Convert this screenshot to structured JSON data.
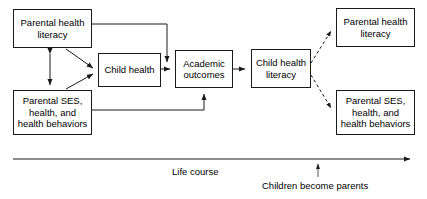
{
  "diagram": {
    "type": "flow-diagram",
    "background_color": "#ffffff",
    "stroke_color": "#1a1a1a",
    "text_color": "#000000",
    "nodes": [
      {
        "id": "parental-health-literacy-left",
        "label": "Parental health\nliteracy",
        "lines": [
          "Parental health",
          "literacy"
        ],
        "x": 13,
        "y": 9,
        "width": 79,
        "height": 39
      },
      {
        "id": "parental-ses-left",
        "label": "Parental SES,\nhealth, and\nhealth behaviors",
        "lines": [
          "Parental SES,",
          "health, and",
          "health behaviors"
        ],
        "x": 13,
        "y": 90,
        "width": 79,
        "height": 45
      },
      {
        "id": "child-health",
        "label": "Child health",
        "lines": [
          "Child health"
        ],
        "x": 98,
        "y": 53,
        "width": 63,
        "height": 34
      },
      {
        "id": "academic-outcomes",
        "label": "Academic\noutcomes",
        "lines": [
          "Academic",
          "outcomes"
        ],
        "x": 175,
        "y": 50,
        "width": 58,
        "height": 38
      },
      {
        "id": "child-health-literacy",
        "label": "Child health\nliteracy",
        "lines": [
          "Child health",
          "literacy"
        ],
        "x": 251,
        "y": 49,
        "width": 60,
        "height": 39
      },
      {
        "id": "parental-health-literacy-right",
        "label": "Parental health\nliteracy",
        "lines": [
          "Parental health",
          "literacy"
        ],
        "x": 336,
        "y": 8,
        "width": 79,
        "height": 39
      },
      {
        "id": "parental-ses-right",
        "label": "Parental SES,\nhealth, and\nhealth behaviors",
        "lines": [
          "Parental SES,",
          "health, and",
          "health behaviors"
        ],
        "x": 336,
        "y": 90,
        "width": 79,
        "height": 45
      }
    ],
    "edges": [
      {
        "from": "parental-health-literacy-left",
        "to": "child-health",
        "style": "solid",
        "arrow": "single"
      },
      {
        "from": "parental-health-literacy-left",
        "to": "academic-outcomes",
        "style": "solid",
        "arrow": "single"
      },
      {
        "from": "parental-ses-left",
        "to": "child-health",
        "style": "solid",
        "arrow": "single"
      },
      {
        "from": "parental-ses-left",
        "to": "academic-outcomes",
        "style": "solid",
        "arrow": "single"
      },
      {
        "from": "parental-health-literacy-left",
        "to": "parental-ses-left",
        "style": "solid",
        "arrow": "double"
      },
      {
        "from": "child-health",
        "to": "academic-outcomes",
        "style": "solid",
        "arrow": "single"
      },
      {
        "from": "academic-outcomes",
        "to": "child-health-literacy",
        "style": "solid",
        "arrow": "single"
      },
      {
        "from": "child-health-literacy",
        "to": "parental-health-literacy-right",
        "style": "dashed",
        "arrow": "single"
      },
      {
        "from": "child-health-literacy",
        "to": "parental-ses-right",
        "style": "dashed",
        "arrow": "single"
      }
    ],
    "timeline": {
      "axis_label": "Life course",
      "axis_label_x": 172,
      "axis_label_y": 166,
      "marker_label": "Children become parents",
      "marker_label_x": 262,
      "marker_label_y": 180,
      "marker_tick_x": 318,
      "start_x": 13,
      "end_x": 416,
      "y": 159
    }
  }
}
